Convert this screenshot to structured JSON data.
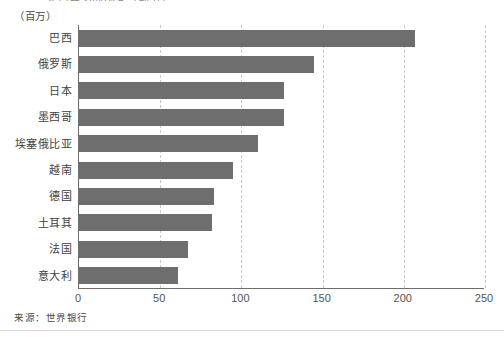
{
  "figure": {
    "clipped_top_title": "人口最多的国家（部分）",
    "unit_caption": "（百万）",
    "source_note": "来源：世界银行"
  },
  "chart_data": {
    "type": "bar",
    "orientation": "horizontal",
    "title": "",
    "xlabel": "",
    "ylabel": "",
    "unit": "百万",
    "xlim": [
      0,
      250
    ],
    "ylim": null,
    "grid": "vertical-dashed",
    "legend": "none",
    "bar_color": "#6e6e6e",
    "categories": [
      "巴西",
      "俄罗斯",
      "日本",
      "墨西哥",
      "埃塞俄比亚",
      "越南",
      "德国",
      "土耳其",
      "法国",
      "意大利"
    ],
    "values": [
      207,
      145,
      126,
      126,
      110,
      95,
      83,
      82,
      67,
      61
    ],
    "xticks": [
      0,
      50,
      100,
      150,
      200,
      250
    ],
    "xtick_labels": [
      "0",
      "50",
      "100",
      "150",
      "200",
      "250"
    ]
  },
  "colors": {
    "bar": "#6e6e6e",
    "axis": "#6d6d6d",
    "grid": "#c9c9c9",
    "text": "#3f3f3f",
    "background": "#ffffff"
  }
}
